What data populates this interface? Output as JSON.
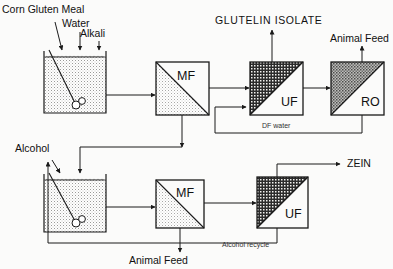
{
  "diagram": {
    "type": "process-flow",
    "background_color": "#fbfbfa",
    "line_color": "#1a1a1a"
  },
  "labels": {
    "corn_gluten_meal": "Corn Gluten Meal",
    "water": "Water",
    "alkali": "Alkali",
    "glutelin_isolate": "GLUTELIN  ISOLATE",
    "animal_feed_top": "Animal Feed",
    "df_water": "DF water",
    "alcohol": "Alcohol",
    "zein": "ZEIN",
    "animal_feed_bottom": "Animal Feed",
    "alcohol_recycle": "Alcohol  recycle"
  },
  "units": {
    "mf_top": "MF",
    "uf_top": "UF",
    "ro_top": "RO",
    "mf_bottom": "MF",
    "uf_bottom": "UF"
  },
  "tanks": {
    "top_tank_name": "alkali-extraction-tank",
    "bottom_tank_name": "alcohol-extraction-tank"
  },
  "fills": {
    "tank_hatch": "#e8e8e6",
    "mf_light": "#ededea",
    "uf_dark": "#3a3a3a",
    "ro_mid": "#8a8a88"
  }
}
